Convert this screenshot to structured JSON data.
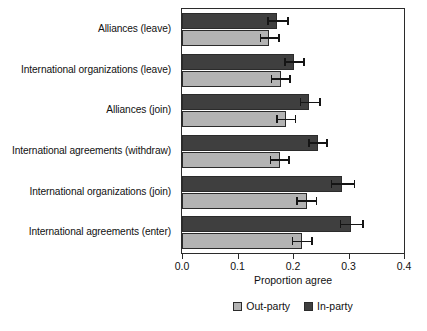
{
  "chart_data": {
    "type": "bar",
    "orientation": "horizontal",
    "title": "",
    "xlabel": "Proportion agree",
    "ylabel": "",
    "xlim": [
      0.0,
      0.4
    ],
    "xticks": [
      "0.0",
      "0.1",
      "0.2",
      "0.3",
      "0.4"
    ],
    "xtick_values": [
      0.0,
      0.1,
      0.2,
      0.3,
      0.4
    ],
    "grid": false,
    "legend_position": "below",
    "categories": [
      "Alliances (leave)",
      "International organizations (leave)",
      "Alliances (join)",
      "International agreements (withdraw)",
      "International organizations (join)",
      "International agreements (enter)"
    ],
    "series": [
      {
        "name": "In-party",
        "color": "#3f3f3f",
        "values": [
          0.172,
          0.201,
          0.228,
          0.245,
          0.289,
          0.305
        ],
        "err_low": [
          0.154,
          0.184,
          0.212,
          0.227,
          0.268,
          0.284
        ],
        "err_high": [
          0.192,
          0.221,
          0.25,
          0.263,
          0.312,
          0.328
        ]
      },
      {
        "name": "Out-party",
        "color": "#b3b3b3",
        "values": [
          0.157,
          0.178,
          0.188,
          0.176,
          0.225,
          0.217
        ],
        "err_low": [
          0.14,
          0.16,
          0.17,
          0.158,
          0.206,
          0.198
        ],
        "err_high": [
          0.176,
          0.196,
          0.206,
          0.194,
          0.244,
          0.236
        ]
      }
    ]
  },
  "legend": {
    "items": [
      {
        "label": "Out-party",
        "key": "outparty"
      },
      {
        "label": "In-party",
        "key": "inparty"
      }
    ]
  },
  "colors": {
    "in_party": "#3f3f3f",
    "out_party": "#b3b3b3",
    "axis": "#2b2b2b",
    "background": "#ffffff"
  }
}
